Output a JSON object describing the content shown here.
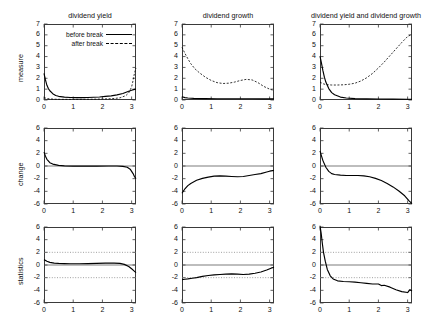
{
  "figure": {
    "columns": [
      {
        "id": "dividend-yield",
        "title": "dividend yield"
      },
      {
        "id": "dividend-growth",
        "title": "dividend growth"
      },
      {
        "id": "dividend-yield-and-dividend-growth",
        "title": "dividend yield and dividend growth"
      }
    ],
    "rows": [
      {
        "id": "measure",
        "label": "measure"
      },
      {
        "id": "change",
        "label": "change"
      },
      {
        "id": "statistics",
        "label": "statistics"
      }
    ]
  },
  "legend": {
    "position": "top-left panel, upper right",
    "entries": [
      {
        "label": "before break",
        "style": "solid"
      },
      {
        "label": "after break",
        "style": "dashed"
      }
    ]
  },
  "axes": {
    "x": {
      "min": 0,
      "max": 3.15,
      "ticks": [
        0,
        1,
        2,
        3
      ],
      "ticklabels": [
        "0",
        "1",
        "2",
        "3"
      ]
    },
    "y_measure": {
      "min": 0,
      "max": 7,
      "ticks": [
        0,
        1,
        2,
        3,
        4,
        5,
        6,
        7
      ],
      "ticklabels": [
        "0",
        "1",
        "2",
        "3",
        "4",
        "5",
        "6",
        "7"
      ]
    },
    "y_change": {
      "min": -6,
      "max": 6,
      "ticks": [
        -6,
        -4,
        -2,
        0,
        2,
        4,
        6
      ],
      "ticklabels": [
        "-6",
        "-4",
        "-2",
        "0",
        "2",
        "4",
        "6"
      ]
    },
    "y_statistics": {
      "min": -6,
      "max": 6,
      "ticks": [
        -6,
        -4,
        -2,
        0,
        2,
        4,
        6
      ],
      "ticklabels": [
        "-6",
        "-4",
        "-2",
        "0",
        "2",
        "4",
        "6"
      ]
    }
  },
  "chart_data": [
    {
      "type": "line",
      "panel": "measure-dividend-yield",
      "title": "dividend yield",
      "xlabel": "",
      "ylabel": "measure",
      "xlim": [
        0,
        3.15
      ],
      "ylim": [
        0,
        7
      ],
      "grid": false,
      "legend": [
        "before break",
        "after break"
      ],
      "series": [
        {
          "name": "before break",
          "style": "solid",
          "x": [
            0,
            0.05,
            0.1,
            0.15,
            0.2,
            0.3,
            0.4,
            0.5,
            0.7,
            0.9,
            1.1,
            1.3,
            1.5,
            1.7,
            1.9,
            2.1,
            2.3,
            2.5,
            2.7,
            2.9,
            3.0,
            3.1,
            3.15
          ],
          "y": [
            2.45,
            1.85,
            1.35,
            1.05,
            0.85,
            0.58,
            0.42,
            0.34,
            0.26,
            0.23,
            0.22,
            0.22,
            0.23,
            0.25,
            0.28,
            0.33,
            0.38,
            0.47,
            0.6,
            0.8,
            0.9,
            0.98,
            1.0
          ]
        },
        {
          "name": "after break",
          "style": "dashed",
          "x": [
            0,
            0.1,
            0.2,
            0.4,
            0.6,
            0.8,
            1.0,
            1.2,
            1.4,
            1.6,
            1.8,
            2.0,
            2.2,
            2.4,
            2.6,
            2.8,
            2.9,
            3.0,
            3.05,
            3.1,
            3.15
          ],
          "y": [
            0.22,
            0.14,
            0.1,
            0.07,
            0.06,
            0.06,
            0.06,
            0.06,
            0.07,
            0.07,
            0.08,
            0.09,
            0.11,
            0.14,
            0.2,
            0.4,
            0.65,
            1.2,
            1.8,
            2.5,
            2.95
          ]
        }
      ]
    },
    {
      "type": "line",
      "panel": "measure-dividend-growth",
      "title": "dividend growth",
      "xlabel": "",
      "ylabel": "measure",
      "xlim": [
        0,
        3.15
      ],
      "ylim": [
        0,
        7
      ],
      "grid": false,
      "legend": [
        "before break",
        "after break"
      ],
      "series": [
        {
          "name": "before break",
          "style": "solid",
          "x": [
            0,
            0.1,
            0.2,
            0.4,
            0.8,
            1.2,
            1.6,
            2.0,
            2.4,
            2.8,
            3.15
          ],
          "y": [
            0.3,
            0.22,
            0.18,
            0.15,
            0.13,
            0.12,
            0.12,
            0.12,
            0.12,
            0.11,
            0.1
          ]
        },
        {
          "name": "after break",
          "style": "dashed",
          "x": [
            0,
            0.1,
            0.2,
            0.3,
            0.45,
            0.6,
            0.8,
            1.0,
            1.2,
            1.4,
            1.6,
            1.8,
            2.0,
            2.2,
            2.4,
            2.6,
            2.8,
            3.0,
            3.15
          ],
          "y": [
            4.85,
            4.3,
            3.8,
            3.35,
            2.85,
            2.5,
            2.1,
            1.8,
            1.6,
            1.52,
            1.55,
            1.65,
            1.8,
            1.9,
            1.85,
            1.6,
            1.25,
            1.0,
            0.88
          ]
        }
      ]
    },
    {
      "type": "line",
      "panel": "measure-dividend-yield-and-dividend-growth",
      "title": "dividend yield and dividend growth",
      "xlabel": "",
      "ylabel": "measure",
      "xlim": [
        0,
        3.15
      ],
      "ylim": [
        0,
        7
      ],
      "grid": false,
      "legend": [
        "before break",
        "after break"
      ],
      "series": [
        {
          "name": "before break",
          "style": "solid",
          "x": [
            0,
            0.05,
            0.1,
            0.15,
            0.2,
            0.3,
            0.4,
            0.5,
            0.7,
            0.9,
            1.2,
            1.6,
            2.0,
            2.5,
            3.0,
            3.15
          ],
          "y": [
            4.05,
            3.4,
            2.7,
            2.1,
            1.65,
            1.05,
            0.68,
            0.48,
            0.27,
            0.18,
            0.13,
            0.1,
            0.09,
            0.08,
            0.07,
            0.07
          ]
        },
        {
          "name": "after break",
          "style": "dashed",
          "x": [
            0,
            0.1,
            0.2,
            0.4,
            0.6,
            0.8,
            1.0,
            1.2,
            1.4,
            1.6,
            1.8,
            2.0,
            2.2,
            2.4,
            2.6,
            2.8,
            3.0,
            3.15
          ],
          "y": [
            1.65,
            1.5,
            1.42,
            1.38,
            1.38,
            1.4,
            1.45,
            1.55,
            1.75,
            2.05,
            2.45,
            2.95,
            3.5,
            4.1,
            4.7,
            5.3,
            5.85,
            6.05
          ]
        }
      ]
    },
    {
      "type": "line",
      "panel": "change-dividend-yield",
      "title": "",
      "xlabel": "",
      "ylabel": "change",
      "xlim": [
        0,
        3.15
      ],
      "ylim": [
        -6,
        6
      ],
      "grid": false,
      "zeroline": 0,
      "series": [
        {
          "name": "change",
          "style": "solid",
          "x": [
            0,
            0.05,
            0.1,
            0.2,
            0.3,
            0.5,
            0.7,
            1.0,
            1.4,
            1.8,
            2.2,
            2.5,
            2.7,
            2.85,
            2.95,
            3.05,
            3.1,
            3.15
          ],
          "y": [
            2.2,
            1.55,
            1.05,
            0.52,
            0.3,
            0.1,
            0.02,
            -0.02,
            -0.02,
            -0.01,
            0.0,
            0.0,
            -0.05,
            -0.2,
            -0.5,
            -1.2,
            -1.7,
            -2.0
          ]
        }
      ]
    },
    {
      "type": "line",
      "panel": "change-dividend-growth",
      "title": "",
      "xlabel": "",
      "ylabel": "change",
      "xlim": [
        0,
        3.15
      ],
      "ylim": [
        -6,
        6
      ],
      "grid": false,
      "zeroline": 0,
      "series": [
        {
          "name": "change",
          "style": "solid",
          "x": [
            0,
            0.1,
            0.2,
            0.3,
            0.5,
            0.7,
            0.9,
            1.1,
            1.3,
            1.5,
            1.7,
            1.9,
            2.1,
            2.3,
            2.5,
            2.7,
            2.9,
            3.0,
            3.15
          ],
          "y": [
            -4.3,
            -3.6,
            -3.1,
            -2.75,
            -2.25,
            -1.95,
            -1.75,
            -1.6,
            -1.55,
            -1.6,
            -1.65,
            -1.7,
            -1.65,
            -1.5,
            -1.35,
            -1.2,
            -0.95,
            -0.82,
            -0.7
          ]
        }
      ]
    },
    {
      "type": "line",
      "panel": "change-dividend-yield-and-dividend-growth",
      "title": "",
      "xlabel": "",
      "ylabel": "change",
      "xlim": [
        0,
        3.15
      ],
      "ylim": [
        -6,
        6
      ],
      "grid": false,
      "zeroline": 0,
      "series": [
        {
          "name": "change",
          "style": "solid",
          "x": [
            0,
            0.05,
            0.1,
            0.2,
            0.3,
            0.4,
            0.5,
            0.7,
            0.9,
            1.1,
            1.3,
            1.5,
            1.7,
            1.9,
            2.1,
            2.3,
            2.5,
            2.7,
            2.9,
            3.05,
            3.15
          ],
          "y": [
            2.4,
            1.6,
            0.85,
            -0.2,
            -0.85,
            -1.2,
            -1.35,
            -1.45,
            -1.5,
            -1.5,
            -1.5,
            -1.55,
            -1.7,
            -1.95,
            -2.3,
            -2.75,
            -3.3,
            -3.95,
            -4.7,
            -5.5,
            -5.95
          ]
        }
      ]
    },
    {
      "type": "line",
      "panel": "statistics-dividend-yield",
      "title": "",
      "xlabel": "",
      "ylabel": "statistics",
      "xlim": [
        0,
        3.15
      ],
      "ylim": [
        -6,
        6
      ],
      "grid": false,
      "zeroline": 0,
      "reference_lines": [
        2,
        -2
      ],
      "reference_line_style": "dotted",
      "series": [
        {
          "name": "statistic",
          "style": "solid",
          "x": [
            0,
            0.1,
            0.2,
            0.35,
            0.5,
            0.7,
            0.9,
            1.2,
            1.5,
            1.8,
            2.1,
            2.4,
            2.6,
            2.75,
            2.9,
            3.0,
            3.1,
            3.15
          ],
          "y": [
            0.85,
            0.6,
            0.42,
            0.3,
            0.25,
            0.22,
            0.2,
            0.2,
            0.22,
            0.25,
            0.3,
            0.3,
            0.25,
            0.1,
            -0.25,
            -0.6,
            -1.0,
            -1.2
          ]
        }
      ]
    },
    {
      "type": "line",
      "panel": "statistics-dividend-growth",
      "title": "",
      "xlabel": "",
      "ylabel": "statistics",
      "xlim": [
        0,
        3.15
      ],
      "ylim": [
        -6,
        6
      ],
      "grid": false,
      "zeroline": 0,
      "reference_lines": [
        2,
        -2
      ],
      "reference_line_style": "dotted",
      "series": [
        {
          "name": "statistic",
          "style": "solid",
          "x": [
            0,
            0.1,
            0.2,
            0.35,
            0.5,
            0.7,
            0.9,
            1.1,
            1.3,
            1.5,
            1.7,
            1.9,
            2.1,
            2.3,
            2.5,
            2.7,
            2.9,
            3.05,
            3.15
          ],
          "y": [
            -2.3,
            -2.25,
            -2.2,
            -2.1,
            -2.0,
            -1.8,
            -1.65,
            -1.55,
            -1.5,
            -1.45,
            -1.4,
            -1.45,
            -1.5,
            -1.45,
            -1.3,
            -1.1,
            -0.8,
            -0.5,
            -0.35
          ]
        }
      ]
    },
    {
      "type": "line",
      "panel": "statistics-dividend-yield-and-dividend-growth",
      "title": "",
      "xlabel": "",
      "ylabel": "statistics",
      "xlim": [
        0,
        3.15
      ],
      "ylim": [
        -6,
        6
      ],
      "grid": false,
      "zeroline": 0,
      "reference_lines": [
        2,
        -2
      ],
      "reference_line_style": "dotted",
      "series": [
        {
          "name": "statistic",
          "style": "solid",
          "x": [
            0,
            0.04,
            0.08,
            0.12,
            0.18,
            0.25,
            0.35,
            0.45,
            0.6,
            0.8,
            1.0,
            1.2,
            1.4,
            1.6,
            1.8,
            2.0,
            2.1,
            2.2,
            2.4,
            2.6,
            2.8,
            3.0,
            3.08,
            3.15
          ],
          "y": [
            6.2,
            5.0,
            3.4,
            2.0,
            0.6,
            -0.7,
            -1.7,
            -2.2,
            -2.5,
            -2.6,
            -2.65,
            -2.7,
            -2.8,
            -2.9,
            -3.0,
            -3.0,
            -3.25,
            -3.2,
            -3.5,
            -3.9,
            -4.2,
            -4.35,
            -3.9,
            -4.1
          ]
        }
      ]
    }
  ]
}
